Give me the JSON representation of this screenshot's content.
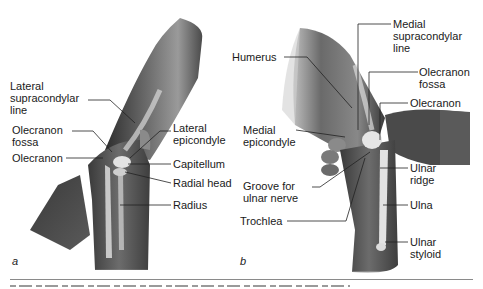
{
  "figure": {
    "panels": [
      {
        "id": "a",
        "letter": "a",
        "labels": [
          {
            "text": "Lateral\nsupracondylar\nline"
          },
          {
            "text": "Olecranon\nfossa"
          },
          {
            "text": "Olecranon"
          },
          {
            "text": "Lateral\nepicondyle"
          },
          {
            "text": "Capitellum"
          },
          {
            "text": "Radial head"
          },
          {
            "text": "Radius"
          }
        ]
      },
      {
        "id": "b",
        "letter": "b",
        "labels": [
          {
            "text": "Humerus"
          },
          {
            "text": "Medial\nepicondyle"
          },
          {
            "text": "Groove for\nulnar nerve"
          },
          {
            "text": "Trochlea"
          },
          {
            "text": "Medial\nsupracondylar\nline"
          },
          {
            "text": "Olecranon\nfossa"
          },
          {
            "text": "Olecranon"
          },
          {
            "text": "Ulnar\nridge"
          },
          {
            "text": "Ulna"
          },
          {
            "text": "Ulnar\nstyloid"
          }
        ]
      }
    ],
    "colors": {
      "skin_dark": "#3c3c3c",
      "skin_mid": "#707070",
      "bone_highlight": "#e6e6e6",
      "leader_line": "#222222",
      "rule": "#8a8a8a"
    }
  }
}
